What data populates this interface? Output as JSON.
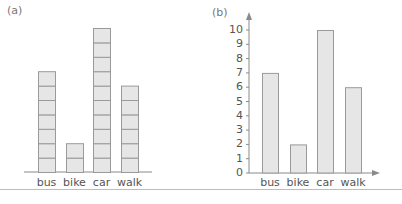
{
  "chart_data": [
    {
      "panel": "(a)",
      "type": "bar",
      "style": "stacked unit squares (pictogram-style block graph)",
      "categories": [
        "bus",
        "bike",
        "car",
        "walk"
      ],
      "values": [
        7,
        2,
        10,
        6
      ],
      "title": "",
      "xlabel": "",
      "ylabel": "",
      "axes": {
        "y_axis_shown": false,
        "baseline_shown": true
      },
      "grid": false,
      "legend": null
    },
    {
      "panel": "(b)",
      "type": "bar",
      "categories": [
        "bus",
        "bike",
        "car",
        "walk"
      ],
      "values": [
        7,
        2,
        10,
        6
      ],
      "title": "",
      "xlabel": "",
      "ylabel": "",
      "ylim": [
        0,
        10
      ],
      "yticks": [
        0,
        1,
        2,
        3,
        4,
        5,
        6,
        7,
        8,
        9,
        10
      ],
      "grid": false,
      "legend": null
    }
  ],
  "panels": {
    "a": {
      "label": "(a)"
    },
    "b": {
      "label": "(b)"
    }
  },
  "colors": {
    "bar_fill": "#e6e6e6",
    "bar_stroke": "#9a9a9a",
    "axis": "#8a8a8a",
    "text": "#555555",
    "rule": "#bdbdbd"
  }
}
